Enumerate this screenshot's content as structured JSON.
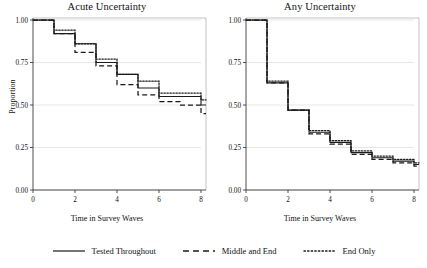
{
  "figure": {
    "ylabel": "Proportion",
    "xlabel_left": "Time in Survey Waves",
    "xlabel_right": "Time in Survey Waves"
  },
  "legend": {
    "items": [
      {
        "label": "Tested Throughout",
        "style": "solid",
        "color": "#1a1a1a"
      },
      {
        "label": "Middle and End",
        "style": "dashed",
        "color": "#1a1a1a"
      },
      {
        "label": "End Only",
        "style": "dotted",
        "color": "#1a1a1a"
      }
    ]
  },
  "chart_data": [
    {
      "type": "line",
      "title": "Acute Uncertainty",
      "xlabel": "Time in Survey Waves",
      "ylabel": "Proportion",
      "xlim": [
        0,
        8
      ],
      "ylim": [
        0,
        1
      ],
      "xticks": [
        0,
        2,
        4,
        6,
        8
      ],
      "xticklabels": [
        "0",
        "2",
        "4",
        "6",
        "8"
      ],
      "yticks": [
        0.0,
        0.25,
        0.5,
        0.75,
        1.0
      ],
      "yticklabels": [
        "0.00",
        "0.25",
        "0.50",
        "0.75",
        "1.00"
      ],
      "grid": "horizontal",
      "legend_position": "below-figure",
      "drawstyle": "steps-post",
      "x": [
        0,
        1,
        2,
        3,
        4,
        5,
        6,
        7,
        8
      ],
      "series": [
        {
          "name": "Tested Throughout",
          "style": "solid",
          "values": [
            1.0,
            0.92,
            0.86,
            0.75,
            0.68,
            0.6,
            0.55,
            0.55,
            0.5
          ]
        },
        {
          "name": "Middle and End",
          "style": "dashed",
          "values": [
            1.0,
            0.92,
            0.81,
            0.73,
            0.62,
            0.56,
            0.52,
            0.5,
            0.45
          ]
        },
        {
          "name": "End Only",
          "style": "dotted",
          "values": [
            1.0,
            0.94,
            0.86,
            0.77,
            0.68,
            0.64,
            0.57,
            0.57,
            0.53
          ]
        }
      ]
    },
    {
      "type": "line",
      "title": "Any Uncertainty",
      "xlabel": "Time in Survey Waves",
      "ylabel": "Proportion",
      "xlim": [
        0,
        8
      ],
      "ylim": [
        0,
        1
      ],
      "xticks": [
        0,
        2,
        4,
        6,
        8
      ],
      "xticklabels": [
        "0",
        "2",
        "4",
        "6",
        "8"
      ],
      "yticks": [
        0.0,
        0.25,
        0.5,
        0.75,
        1.0
      ],
      "yticklabels": [
        "0.00",
        "0.25",
        "0.50",
        "0.75",
        "1.00"
      ],
      "grid": "horizontal",
      "legend_position": "below-figure",
      "drawstyle": "steps-post",
      "x": [
        0,
        1,
        2,
        3,
        4,
        5,
        6,
        7,
        8
      ],
      "series": [
        {
          "name": "Tested Throughout",
          "style": "solid",
          "values": [
            1.0,
            0.63,
            0.47,
            0.34,
            0.28,
            0.22,
            0.19,
            0.17,
            0.15
          ]
        },
        {
          "name": "Middle and End",
          "style": "dashed",
          "values": [
            1.0,
            0.63,
            0.47,
            0.33,
            0.27,
            0.21,
            0.18,
            0.16,
            0.14
          ]
        },
        {
          "name": "End Only",
          "style": "dotted",
          "values": [
            1.0,
            0.64,
            0.47,
            0.35,
            0.29,
            0.23,
            0.2,
            0.18,
            0.16
          ]
        }
      ]
    }
  ]
}
